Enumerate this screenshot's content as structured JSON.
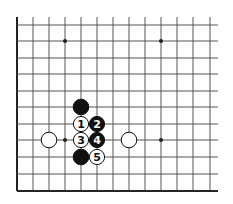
{
  "diagram": {
    "type": "go-board-fragment",
    "colors": {
      "line": "#555555",
      "edge": "#222222",
      "black": "#111111",
      "white": "#ffffff",
      "background": "#ffffff"
    },
    "grid": {
      "x": [
        17,
        33,
        49,
        65,
        81,
        97,
        113,
        129,
        145,
        161,
        177,
        193,
        210
      ],
      "y": [
        25,
        41,
        58,
        74,
        91,
        107,
        124,
        140,
        157,
        174,
        191
      ],
      "top_extend": 17,
      "right_extend": 218
    },
    "star_points": [
      {
        "x": 65,
        "y": 41
      },
      {
        "x": 161,
        "y": 41
      },
      {
        "x": 65,
        "y": 140
      },
      {
        "x": 161,
        "y": 140
      }
    ],
    "stones": [
      {
        "color": "black",
        "x": 81,
        "y": 107,
        "label": ""
      },
      {
        "color": "white",
        "x": 81,
        "y": 124,
        "label": "1"
      },
      {
        "color": "black",
        "x": 97,
        "y": 124,
        "label": "2"
      },
      {
        "color": "white",
        "x": 81,
        "y": 140,
        "label": "3"
      },
      {
        "color": "black",
        "x": 97,
        "y": 140,
        "label": "4"
      },
      {
        "color": "black",
        "x": 81,
        "y": 157,
        "label": ""
      },
      {
        "color": "white",
        "x": 97,
        "y": 157,
        "label": "5"
      },
      {
        "color": "white",
        "x": 49,
        "y": 140,
        "label": ""
      },
      {
        "color": "white",
        "x": 129,
        "y": 140,
        "label": ""
      }
    ]
  }
}
